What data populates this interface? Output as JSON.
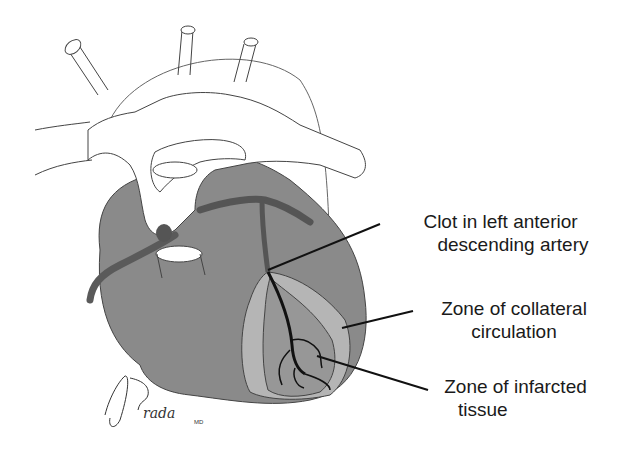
{
  "labels": {
    "clot": {
      "line1": "Clot in left anterior",
      "line2": "descending artery"
    },
    "collateral": {
      "line1": "Zone of collateral",
      "line2": "circulation"
    },
    "infarcted": {
      "line1": "Zone of infarcted",
      "line2": "tissue"
    }
  },
  "signature": {
    "name": "ABrada",
    "suffix": "MD"
  },
  "colors": {
    "heart": "#8a8a8a",
    "collateral_zone": "#b5b5b5",
    "infarct_zone": "#979797",
    "artery": "#5a5a5a",
    "vessel_outline": "#555555",
    "leader_line": "#111111"
  }
}
